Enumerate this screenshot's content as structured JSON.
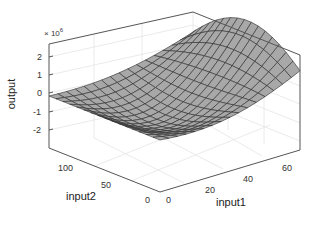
{
  "chart_data": {
    "type": "surface3d",
    "title": "",
    "xlabel": "input1",
    "ylabel": "input2",
    "zlabel": "output",
    "z_exponent_label": "× 10^6",
    "z_exponent_base": "× 10",
    "z_exponent_power": "6",
    "xlim": [
      0,
      64
    ],
    "ylim": [
      0,
      128
    ],
    "zlim": [
      -2.8,
      2.8
    ],
    "x_ticks": [
      "0",
      "20",
      "40",
      "60"
    ],
    "y_ticks": [
      "0",
      "50",
      "100"
    ],
    "z_ticks": [
      "2",
      "1",
      "0",
      "-1",
      "-2"
    ],
    "grid": true,
    "surface_color": "#a8a8a8",
    "edge_color": "#2a2a2a",
    "grid_size": [
      16,
      16
    ]
  }
}
